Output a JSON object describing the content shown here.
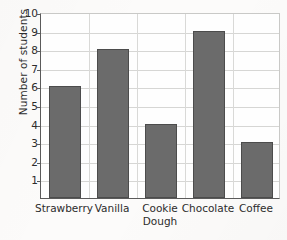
{
  "chart_data": {
    "type": "bar",
    "title": "",
    "xlabel": "",
    "ylabel": "Number of students",
    "categories": [
      "Strawberry",
      "Vanilla",
      "Cookie Dough",
      "Chocolate",
      "Coffee"
    ],
    "values": [
      6,
      8,
      4,
      9,
      3
    ],
    "ylim": [
      0,
      10
    ],
    "ytick_labels": [
      "10",
      "9",
      "8",
      "7",
      "6",
      "5",
      "4",
      "3",
      "2",
      "1"
    ],
    "ytick_values": [
      10,
      9,
      8,
      7,
      6,
      5,
      4,
      3,
      2,
      1
    ],
    "grid": true,
    "legend": "none",
    "bar_color": "#6b6b6b",
    "bar_edge_color": "#4c4c4c",
    "grid_color": "#d6d6d4",
    "axis_color": "#5a5a5a",
    "background_color": "#fcfbfa"
  }
}
